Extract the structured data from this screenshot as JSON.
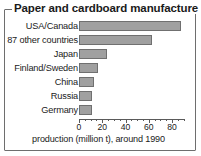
{
  "chart_data": {
    "type": "bar",
    "orientation": "horizontal",
    "title": "Paper and cardboard manufacture",
    "subtitle": "",
    "xlabel": "production (million t), around 1990",
    "ylabel": "",
    "categories": [
      "USA/Canada",
      "87 other countries",
      "Japan",
      "Finland/Sweden",
      "China",
      "Russia",
      "Germany"
    ],
    "values": [
      88,
      63,
      24,
      16,
      13,
      11,
      11
    ],
    "xlim": [
      0,
      91
    ],
    "xticks": [
      0,
      20,
      40,
      60,
      80
    ],
    "xtick_labels": [
      "0",
      "20",
      "40",
      "60",
      "80"
    ],
    "minor_tick_step": 5,
    "grid": false,
    "legend": null,
    "bar_color": "#a0a0a0",
    "bar_edge_color": "#707070",
    "frame_color": "#6e6e6e",
    "text_color": "#1a1a1a"
  }
}
